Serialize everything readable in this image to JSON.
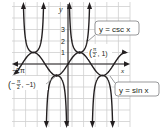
{
  "figure": {
    "axes": {
      "x_label": "x",
      "y_label": "y",
      "x_tick_labels": [
        "−2π"
      ],
      "y_tick_labels": [
        "1",
        "2",
        "3"
      ]
    },
    "curves": [
      {
        "name": "cosecant",
        "label": "y = csc x"
      },
      {
        "name": "sine",
        "label": "y = sin x"
      }
    ],
    "points": [
      {
        "label_num": "π",
        "label_den": "2",
        "label_rest": ", 1)",
        "open": "(",
        "coords": "(π/2, 1)"
      },
      {
        "label_num": "π",
        "label_den": "2",
        "label_rest": ", −1)",
        "open": "(−",
        "coords": "(−π/2, −1)"
      }
    ],
    "colors": {
      "curve": "#231f20",
      "grid": "#c8c8c8",
      "callout_border": "#6d6e71",
      "background": "#ffffff"
    }
  }
}
